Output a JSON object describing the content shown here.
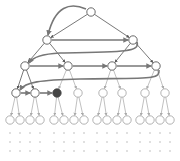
{
  "diagram": {
    "type": "tree-traversal",
    "colors": {
      "edge_dark": "#555555",
      "edge_light": "#b0b0b0",
      "traversal_arrow": "#777777",
      "node_fill": "#ffffff",
      "node_stroke_dark": "#444444",
      "node_stroke_light": "#a0a0a0",
      "active_node_fill": "#444444",
      "dot": "#b8b8b8"
    },
    "levels": [
      {
        "level": 1,
        "y": 12,
        "nodes": [
          91
        ]
      },
      {
        "level": 2,
        "y": 40,
        "nodes": [
          47,
          133
        ]
      },
      {
        "level": 3,
        "y": 66,
        "nodes": [
          25,
          68,
          112,
          156
        ]
      },
      {
        "level": 4,
        "y": 93,
        "nodes": [
          16,
          35,
          57,
          78,
          103,
          122,
          145,
          165
        ]
      },
      {
        "level": 5,
        "y": 120,
        "nodes": [
          10,
          20,
          30,
          40,
          54,
          64,
          74,
          84,
          97,
          107,
          117,
          127,
          140,
          150,
          160,
          170
        ]
      }
    ],
    "active_node": {
      "level": 4,
      "index": 2
    },
    "dot_rows_y": [
      133,
      142,
      151
    ]
  }
}
